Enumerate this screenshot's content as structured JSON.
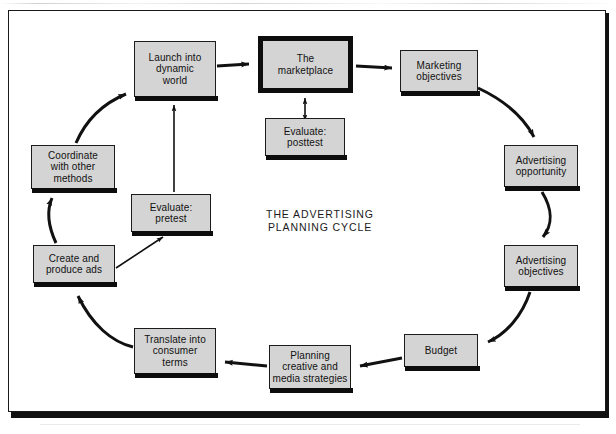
{
  "figure": {
    "caption_line1": "THE ADVERTISING",
    "caption_line2": "PLANNING CYCLE",
    "colors": {
      "box_fill": "#d4d4d4",
      "box_border": "#1c1c1c",
      "box_shadow": "#0d0d0d",
      "arrow": "#111111",
      "page_background": "#ffffff"
    }
  },
  "nodes": [
    {
      "id": "launch",
      "label": "Launch into dynamic world",
      "line1": "Launch into",
      "line2": "dynamic",
      "line3": "world",
      "x": 134,
      "y": 41,
      "w": 82,
      "h": 56,
      "emphasis": false
    },
    {
      "id": "marketplace",
      "label": "The marketplace",
      "line1": "The",
      "line2": "marketplace",
      "line3": "",
      "x": 258,
      "y": 36,
      "w": 95,
      "h": 57,
      "emphasis": true
    },
    {
      "id": "marketing",
      "label": "Marketing objectives",
      "line1": "Marketing",
      "line2": "objectives",
      "line3": "",
      "x": 400,
      "y": 50,
      "w": 78,
      "h": 42,
      "emphasis": false
    },
    {
      "id": "opportunity",
      "label": "Advertising opportunity",
      "line1": "Advertising",
      "line2": "opportunity",
      "line3": "",
      "x": 504,
      "y": 145,
      "w": 74,
      "h": 42,
      "emphasis": false
    },
    {
      "id": "adobjectives",
      "label": "Advertising objectives",
      "line1": "Advertising",
      "line2": "objectives",
      "line3": "",
      "x": 504,
      "y": 245,
      "w": 74,
      "h": 42,
      "emphasis": false
    },
    {
      "id": "budget",
      "label": "Budget",
      "line1": "Budget",
      "line2": "",
      "line3": "",
      "x": 404,
      "y": 334,
      "w": 74,
      "h": 33,
      "emphasis": false
    },
    {
      "id": "strategies",
      "label": "Planning creative and media strategies",
      "line1": "Planning",
      "line2": "creative and",
      "line3": "media strategies",
      "x": 269,
      "y": 345,
      "w": 82,
      "h": 44,
      "emphasis": false
    },
    {
      "id": "translate",
      "label": "Translate into consumer terms",
      "line1": "Translate into",
      "line2": "consumer",
      "line3": "terms",
      "x": 134,
      "y": 328,
      "w": 82,
      "h": 46,
      "emphasis": false
    },
    {
      "id": "create",
      "label": "Create and produce ads",
      "line1": "Create and",
      "line2": "produce ads",
      "line3": "",
      "x": 33,
      "y": 245,
      "w": 82,
      "h": 38,
      "emphasis": false
    },
    {
      "id": "coordinate",
      "label": "Coordinate with other methods",
      "line1": "Coordinate",
      "line2": "with other",
      "line3": "methods",
      "x": 31,
      "y": 145,
      "w": 84,
      "h": 44,
      "emphasis": false
    },
    {
      "id": "pretest",
      "label": "Evaluate: pretest",
      "line1": "Evaluate:",
      "line2": "pretest",
      "line3": "",
      "x": 131,
      "y": 194,
      "w": 80,
      "h": 38,
      "emphasis": false
    },
    {
      "id": "posttest",
      "label": "Evaluate: posttest",
      "line1": "Evaluate:",
      "line2": "posttest",
      "line3": "",
      "x": 265,
      "y": 118,
      "w": 80,
      "h": 38,
      "emphasis": false
    }
  ],
  "connections": [
    {
      "from": "launch",
      "to": "marketplace",
      "style": "straight",
      "arrows": "single"
    },
    {
      "from": "marketplace",
      "to": "marketing",
      "style": "straight",
      "arrows": "single"
    },
    {
      "from": "posttest",
      "to": "marketplace",
      "style": "straight",
      "arrows": "double"
    },
    {
      "from": "marketing",
      "to": "opportunity",
      "style": "curve",
      "arrows": "single"
    },
    {
      "from": "opportunity",
      "to": "adobjectives",
      "style": "curve",
      "arrows": "single"
    },
    {
      "from": "adobjectives",
      "to": "budget",
      "style": "curve",
      "arrows": "single"
    },
    {
      "from": "budget",
      "to": "strategies",
      "style": "straight",
      "arrows": "single"
    },
    {
      "from": "strategies",
      "to": "translate",
      "style": "straight",
      "arrows": "single"
    },
    {
      "from": "translate",
      "to": "create",
      "style": "curve",
      "arrows": "single"
    },
    {
      "from": "create",
      "to": "coordinate",
      "style": "curve",
      "arrows": "single"
    },
    {
      "from": "coordinate",
      "to": "launch",
      "style": "curve",
      "arrows": "single"
    },
    {
      "from": "create",
      "to": "pretest",
      "style": "straight",
      "arrows": "single"
    },
    {
      "from": "pretest",
      "to": "launch",
      "style": "straight",
      "arrows": "single"
    }
  ]
}
